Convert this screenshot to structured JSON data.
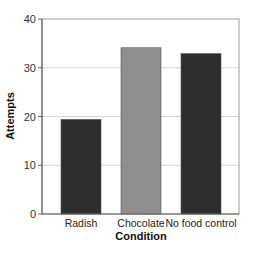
{
  "chart_data": {
    "type": "bar",
    "title": "",
    "xlabel": "Condition",
    "ylabel": "Attempts",
    "categories": [
      "Radish",
      "Chocolate",
      "No food control"
    ],
    "values": [
      19.4,
      34.1,
      32.9
    ],
    "colors": [
      "#2e2e2e",
      "#8f8f8f",
      "#2e2e2e"
    ],
    "ylim": [
      0,
      40
    ],
    "yticks": [
      0,
      10,
      20,
      30,
      40
    ],
    "grid": true,
    "legend": null
  }
}
